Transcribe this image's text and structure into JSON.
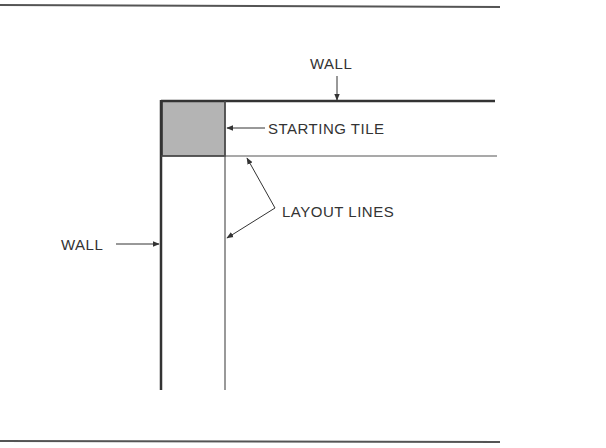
{
  "diagram": {
    "type": "floor-tile-layout",
    "labels": {
      "wall_top": "WALL",
      "wall_left": "WALL",
      "starting_tile": "STARTING TILE",
      "layout_lines": "LAYOUT LINES"
    },
    "colors": {
      "line": "#333333",
      "tile_fill": "#b4b4b4",
      "rule": "#555555"
    }
  }
}
